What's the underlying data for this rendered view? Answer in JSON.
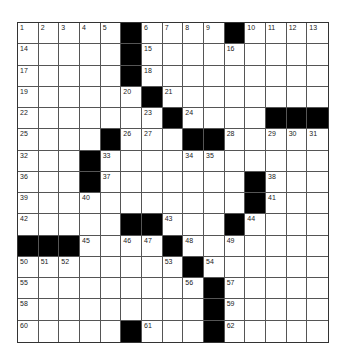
{
  "puzzle": {
    "rows": 15,
    "cols": 15,
    "grid": [
      [
        "1",
        "2",
        "3",
        "4",
        "5",
        "#",
        "6",
        "7",
        "8",
        "9",
        "#",
        "10",
        "11",
        "12",
        "13"
      ],
      [
        "14",
        "",
        "",
        "",
        "",
        "#",
        "15",
        "",
        "",
        "",
        "16",
        "",
        "",
        "",
        ""
      ],
      [
        "17",
        "",
        "",
        "",
        "",
        "#",
        "18",
        "",
        "",
        "",
        "",
        "",
        "",
        "",
        ""
      ],
      [
        "19",
        "",
        "",
        "",
        "",
        "20",
        "#",
        "21",
        "",
        "",
        "",
        "",
        "",
        "",
        ""
      ],
      [
        "22",
        "",
        "",
        "",
        "",
        "",
        "23",
        "#",
        "24",
        "",
        "",
        "",
        "#",
        "#",
        "#"
      ],
      [
        "25",
        "",
        "",
        "",
        "#",
        "26",
        "27",
        "",
        "#",
        "#",
        "28",
        "",
        "29",
        "30",
        "31"
      ],
      [
        "32",
        "",
        "",
        "#",
        "33",
        "",
        "",
        "",
        "34",
        "35",
        "",
        "",
        "",
        "",
        ""
      ],
      [
        "36",
        "",
        "",
        "#",
        "37",
        "",
        "",
        "",
        "",
        "",
        "",
        "#",
        "38",
        "",
        ""
      ],
      [
        "39",
        "",
        "",
        "40",
        "",
        "",
        "",
        "",
        "",
        "",
        "",
        "#",
        "41",
        "",
        ""
      ],
      [
        "42",
        "",
        "",
        "",
        "",
        "#",
        "#",
        "43",
        "",
        "",
        "#",
        "44",
        "",
        "",
        ""
      ],
      [
        "#",
        "#",
        "#",
        "45",
        "",
        "46",
        "47",
        "#",
        "48",
        "",
        "49",
        "",
        "",
        "",
        ""
      ],
      [
        "50",
        "51",
        "52",
        "",
        "",
        "",
        "",
        "53",
        "#",
        "54",
        "",
        "",
        "",
        "",
        ""
      ],
      [
        "55",
        "",
        "",
        "",
        "",
        "",
        "",
        "",
        "56",
        "#",
        "57",
        "",
        "",
        "",
        ""
      ],
      [
        "58",
        "",
        "",
        "",
        "",
        "",
        "",
        "",
        "",
        "#",
        "59",
        "",
        "",
        "",
        ""
      ],
      [
        "60",
        "",
        "",
        "",
        "",
        "#",
        "61",
        "",
        "",
        "#",
        "62",
        "",
        "",
        "",
        ""
      ]
    ],
    "colors": {
      "block": "#000000",
      "cell": "#ffffff",
      "line": "#555555"
    }
  }
}
